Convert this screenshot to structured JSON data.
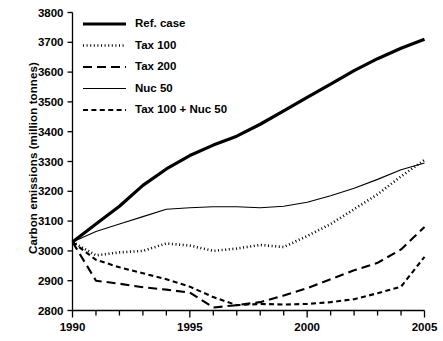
{
  "chart_data": {
    "type": "line",
    "title": "",
    "xlabel": "",
    "ylabel": "Carbon emissions (million tonnes)",
    "xlim": [
      1990,
      2005
    ],
    "ylim": [
      2800,
      3800
    ],
    "grid": false,
    "legend_position": "top-left",
    "x": [
      1990,
      1991,
      1992,
      1993,
      1994,
      1995,
      1996,
      1997,
      1998,
      1999,
      2000,
      2001,
      2002,
      2003,
      2004,
      2005
    ],
    "x_tick_labels": [
      "1990",
      "1995",
      "2000",
      "2005"
    ],
    "x_tick_values": [
      1990,
      1995,
      2000,
      2005
    ],
    "x_minor_ticks": [
      1991,
      1992,
      1993,
      1994,
      1996,
      1997,
      1998,
      1999,
      2001,
      2002,
      2003,
      2004
    ],
    "y_tick_labels": [
      "2800",
      "2900",
      "3000",
      "3100",
      "3200",
      "3300",
      "3400",
      "3500",
      "3600",
      "3700",
      "3800"
    ],
    "y_tick_values": [
      2800,
      2900,
      3000,
      3100,
      3200,
      3300,
      3400,
      3500,
      3600,
      3700,
      3800
    ],
    "series": [
      {
        "name": "Ref. case",
        "style": "solid-thick",
        "stroke_width": 3.2,
        "dash": "none",
        "values": [
          3030,
          3090,
          3150,
          3220,
          3275,
          3320,
          3355,
          3385,
          3425,
          3470,
          3515,
          3560,
          3605,
          3645,
          3680,
          3710
        ]
      },
      {
        "name": "Tax 100",
        "style": "dotted",
        "stroke_width": 2.6,
        "dash": "1,2.6",
        "values": [
          3030,
          2985,
          2995,
          3000,
          3025,
          3018,
          3000,
          3008,
          3020,
          3013,
          3050,
          3090,
          3140,
          3190,
          3250,
          3305
        ]
      },
      {
        "name": "Tax 200",
        "style": "long-dash",
        "stroke_width": 2.1,
        "dash": "9,5",
        "values": [
          3030,
          2900,
          2890,
          2878,
          2870,
          2860,
          2810,
          2818,
          2828,
          2850,
          2875,
          2905,
          2935,
          2960,
          3005,
          3080
        ]
      },
      {
        "name": "Nuc 50",
        "style": "solid-thin",
        "stroke_width": 1.1,
        "dash": "none",
        "values": [
          3030,
          3065,
          3090,
          3115,
          3140,
          3145,
          3148,
          3148,
          3145,
          3150,
          3163,
          3185,
          3210,
          3240,
          3272,
          3295
        ]
      },
      {
        "name": "Tax 100 + Nuc 50",
        "style": "short-dash",
        "stroke_width": 2.1,
        "dash": "5,3.4",
        "values": [
          3030,
          2970,
          2945,
          2925,
          2905,
          2880,
          2845,
          2818,
          2822,
          2820,
          2822,
          2828,
          2838,
          2858,
          2880,
          2980
        ]
      }
    ]
  },
  "legend": {
    "items": [
      {
        "label": "Ref. case"
      },
      {
        "label": "Tax 100"
      },
      {
        "label": "Tax 200"
      },
      {
        "label": "Nuc 50"
      },
      {
        "label": "Tax 100 + Nuc 50"
      }
    ]
  },
  "axis": {
    "y_title": "Carbon emissions (million tonnes)"
  }
}
